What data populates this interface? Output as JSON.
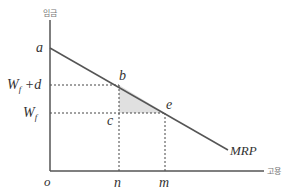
{
  "diagram": {
    "title": "",
    "y_axis_label": "임금",
    "x_axis_label": "고용",
    "origin_label": "o",
    "curve_label": "MRP",
    "points": {
      "a": "a",
      "b": "b",
      "c": "c",
      "e": "e"
    },
    "y_levels": {
      "upper": "W_f + d",
      "lower": "W_f"
    },
    "x_levels": {
      "n": "n",
      "m": "m"
    },
    "colors": {
      "line": "#555555",
      "shade": "#e0e0e0",
      "text": "#333333"
    }
  }
}
